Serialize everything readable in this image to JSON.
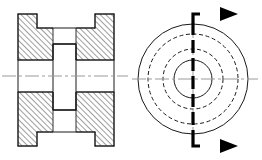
{
  "drawing": {
    "title": "Two-view engineering drawing: full section view and end view",
    "background_color": "#ffffff",
    "line_color": "#1a1a1a",
    "centerline_color": "#9a9a9a",
    "cutting_plane_color": "#000000",
    "canvas": {
      "width": 262,
      "height": 160
    }
  },
  "section_view": {
    "name": "sectional-front-view",
    "description": "Full section of a flanged hub / bushing with central bore, material shown with 45 degree section hatching",
    "bounds": {
      "x": 18,
      "y": 14,
      "width": 96,
      "height": 132
    },
    "axis": {
      "y": 76,
      "x_start": 2,
      "x_end": 128
    },
    "geometry": {
      "left_flange_x": 18,
      "left_flange_inner_x": 37,
      "right_flange_inner_x": 95,
      "right_flange_x": 114,
      "body_top_y": 28,
      "body_bottom_y": 132,
      "flange_top_y": 14,
      "flange_bottom_y": 146,
      "bore_top_y": 60,
      "bore_bottom_y": 92,
      "rib_left_x": 53,
      "rib_right_x": 76,
      "rib_top_y": 44,
      "rib_bottom_y": 110
    },
    "hatch": {
      "angle_degrees": 45,
      "direction": "rising-to-the-right",
      "spacing_px": 4,
      "stroke_width": 0.9
    }
  },
  "end_view": {
    "name": "end-view",
    "description": "End view showing concentric circles: outer diameter, two hidden (dashed) diameters and the bore",
    "center": {
      "x": 193,
      "y": 79
    },
    "circles": [
      {
        "name": "outer-diameter-circle",
        "radius": 55,
        "style": "solid",
        "meaning": "flange outer diameter"
      },
      {
        "name": "hidden-diameter-circle-large",
        "radius": 45,
        "style": "dashed",
        "meaning": "hub outer diameter (hidden)"
      },
      {
        "name": "hidden-diameter-circle-small",
        "radius": 30,
        "style": "dashed",
        "meaning": "rib / counterbore diameter (hidden)"
      },
      {
        "name": "bore-circle",
        "radius": 19,
        "style": "solid",
        "meaning": "central bore diameter"
      }
    ],
    "horizontal_centerline": {
      "y": 79,
      "x_start": 132,
      "x_end": 258
    },
    "vertical_centerline": {
      "x": 193,
      "y_start": 18,
      "y_end": 140
    }
  },
  "cutting_plane": {
    "name": "cutting-plane-line",
    "label": "",
    "style": "thick-dashed",
    "vertical_x": 193,
    "top_y": 22,
    "bottom_y": 138,
    "arrows": [
      {
        "name": "cutting-plane-arrow-top",
        "direction": "right",
        "leg_y": 14,
        "tip_x": 238,
        "tail_x": 200
      },
      {
        "name": "cutting-plane-arrow-bottom",
        "direction": "right",
        "leg_y": 146,
        "tip_x": 238,
        "tail_x": 200
      }
    ],
    "arrow_head": {
      "length": 18,
      "half_width": 7
    }
  }
}
